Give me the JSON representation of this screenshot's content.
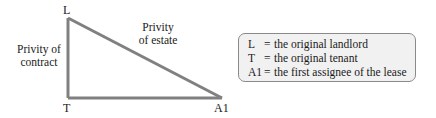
{
  "diagram": {
    "type": "privity-triangle",
    "line_color": "#808080",
    "vertices": {
      "L": "L",
      "T": "T",
      "A1": "A1"
    },
    "edges": {
      "vertical": {
        "line1": "Privity of",
        "line2": "contract"
      },
      "diagonal": {
        "line1": "Privity",
        "line2": "of estate"
      }
    }
  },
  "legend": {
    "items": [
      {
        "key": "L",
        "eq": "=",
        "text": "the original landlord"
      },
      {
        "key": "T",
        "eq": "=",
        "text": "the original tenant"
      },
      {
        "key": "A1",
        "eq": "=",
        "text": "the first assignee of the lease"
      }
    ]
  }
}
